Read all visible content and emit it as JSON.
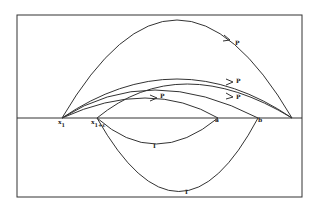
{
  "diagram": {
    "frame": {
      "x": 17,
      "y": 15,
      "width": 285,
      "height": 182
    },
    "axis_y": 118,
    "color": "#333333",
    "points": {
      "x1": {
        "label": "x",
        "sub": "1",
        "x": 62
      },
      "x1e": {
        "label": "x",
        "sub": "1+ε",
        "x": 97
      },
      "a": {
        "label": "a",
        "x": 218
      },
      "b": {
        "label": "b",
        "x": 258
      },
      "end": {
        "x": 292
      }
    },
    "curve_labels": {
      "p": "P",
      "i": "I"
    }
  }
}
